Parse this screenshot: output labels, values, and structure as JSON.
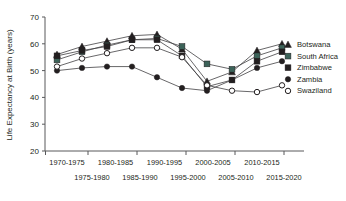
{
  "chart_data": {
    "type": "line",
    "title": "",
    "xlabel": "",
    "ylabel": "Life Expectancy at Birth (years)",
    "ylim": [
      20,
      70
    ],
    "yticks": [
      20,
      30,
      40,
      50,
      60,
      70
    ],
    "ytick_labels": [
      "20",
      "30",
      "40",
      "50",
      "60",
      "70"
    ],
    "grid": false,
    "legend_position": "right",
    "categories": [
      "1970-1975",
      "1975-1980",
      "1980-1985",
      "1985-1990",
      "1990-1995",
      "1995-2000",
      "2000-2005",
      "2005-2010",
      "2010-2015",
      "2015-2020"
    ],
    "xtick_labels_top": [
      "1970-1975",
      "1980-1985",
      "1990-1995",
      "2000-2005",
      "2010-2015"
    ],
    "xtick_labels_bottom": [
      "1975-1980",
      "1985-1990",
      "1995-2000",
      "2005-2010",
      "2015-2020"
    ],
    "series": [
      {
        "name": "Botswana",
        "marker": "triangle",
        "color": "#231f20",
        "values": [
          56.0,
          59.0,
          61.0,
          63.0,
          63.5,
          58.0,
          46.0,
          49.5,
          57.5,
          60.0
        ]
      },
      {
        "name": "South Africa",
        "marker": "square-green",
        "color": "#3c6359",
        "values": [
          54.0,
          57.0,
          59.5,
          61.5,
          62.0,
          59.0,
          52.5,
          50.5,
          55.5,
          58.5
        ]
      },
      {
        "name": "Zimbabwe",
        "marker": "square",
        "color": "#231f20",
        "values": [
          55.5,
          57.5,
          59.0,
          61.5,
          61.5,
          55.5,
          44.0,
          46.5,
          53.5,
          57.0
        ]
      },
      {
        "name": "Zambia",
        "marker": "circle-filled",
        "color": "#231f20",
        "values": [
          50.0,
          51.0,
          51.5,
          51.5,
          47.5,
          43.5,
          42.5,
          46.5,
          51.0,
          53.5
        ]
      },
      {
        "name": "Swaziland",
        "marker": "circle-open",
        "color": "#231f20",
        "values": [
          51.5,
          54.5,
          56.5,
          58.5,
          58.5,
          55.0,
          44.5,
          42.5,
          42.0,
          44.5
        ]
      }
    ]
  },
  "legend": {
    "items": [
      {
        "label": "Botswana"
      },
      {
        "label": "South Africa"
      },
      {
        "label": "Zimbabwe"
      },
      {
        "label": "Zambia"
      },
      {
        "label": "Swaziland"
      }
    ]
  }
}
